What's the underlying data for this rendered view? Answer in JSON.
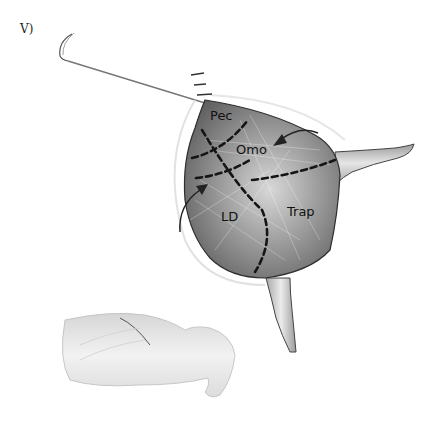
{
  "figure": {
    "panel_label": "V)",
    "labels": {
      "pec": "Pec",
      "omo": "Omo",
      "ld": "LD",
      "trap": "Trap"
    },
    "elements": [
      "suture-needle",
      "suture-thread",
      "skin-flap",
      "dashed-incision-lines",
      "rotation-arrows",
      "forelimb",
      "hindlimb",
      "animal-body"
    ],
    "colors": {
      "flap_fill": "#8a8a8a",
      "flap_light": "#c8c8c8",
      "dash": "#1a1a1a",
      "outline": "#333333",
      "background": "#ffffff"
    }
  }
}
